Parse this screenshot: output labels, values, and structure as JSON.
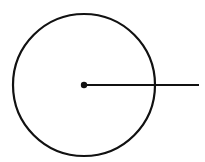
{
  "diagram": {
    "type": "circle-with-radius",
    "background": "#ffffff",
    "stroke_color": "#111111",
    "circle": {
      "cx": 84,
      "cy": 85,
      "r": 71,
      "stroke_width": 2.2
    },
    "center_point": {
      "cx": 84,
      "cy": 85,
      "r": 3.2
    },
    "radius_line": {
      "x1": 84,
      "y1": 85,
      "x2": 199,
      "y2": 85,
      "stroke_width": 2
    }
  }
}
